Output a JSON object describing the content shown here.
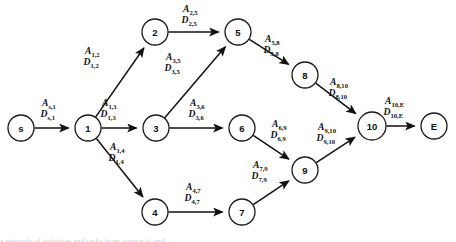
{
  "figure": {
    "type": "directed-acyclic-graph",
    "title": "",
    "background_color": "#ffffff",
    "stroke_color": "#111111",
    "node_fill": "#ffffff",
    "caption_partial": "a network of activities and tasks from source to end"
  },
  "nodes": [
    {
      "id": "s",
      "label": "s",
      "cx": 21,
      "cy": 128,
      "r": 13
    },
    {
      "id": "1",
      "label": "1",
      "cx": 88,
      "cy": 128,
      "r": 13
    },
    {
      "id": "2",
      "label": "2",
      "cx": 155,
      "cy": 32,
      "r": 13
    },
    {
      "id": "3",
      "label": "3",
      "cx": 156,
      "cy": 128,
      "r": 13
    },
    {
      "id": "4",
      "label": "4",
      "cx": 155,
      "cy": 212,
      "r": 13
    },
    {
      "id": "5",
      "label": "5",
      "cx": 238,
      "cy": 32,
      "r": 13
    },
    {
      "id": "6",
      "label": "6",
      "cx": 242,
      "cy": 128,
      "r": 13
    },
    {
      "id": "7",
      "label": "7",
      "cx": 242,
      "cy": 212,
      "r": 13
    },
    {
      "id": "8",
      "label": "8",
      "cx": 305,
      "cy": 75,
      "r": 13
    },
    {
      "id": "9",
      "label": "9",
      "cx": 305,
      "cy": 170,
      "r": 13
    },
    {
      "id": "10",
      "label": "10",
      "cx": 372,
      "cy": 126,
      "r": 14
    },
    {
      "id": "E",
      "label": "E",
      "cx": 434,
      "cy": 126,
      "r": 13
    }
  ],
  "edges": [
    {
      "from": "s",
      "to": "1",
      "activity": "A",
      "duration": "D",
      "sub": "s,1",
      "label_x": 42,
      "label_y": 106
    },
    {
      "from": "1",
      "to": "2",
      "activity": "A",
      "duration": "D",
      "sub": "1,2",
      "label_x": 85,
      "label_y": 54
    },
    {
      "from": "1",
      "to": "3",
      "activity": "A",
      "duration": "D",
      "sub": "1,3",
      "label_x": 102,
      "label_y": 106
    },
    {
      "from": "1",
      "to": "4",
      "activity": "A",
      "duration": "D",
      "sub": "1,4",
      "label_x": 110,
      "label_y": 150
    },
    {
      "from": "2",
      "to": "5",
      "activity": "A",
      "duration": "D",
      "sub": "2,5",
      "label_x": 183,
      "label_y": 12
    },
    {
      "from": "3",
      "to": "5",
      "activity": "A",
      "duration": "D",
      "sub": "3,5",
      "label_x": 166,
      "label_y": 60
    },
    {
      "from": "3",
      "to": "6",
      "activity": "A",
      "duration": "D",
      "sub": "3,6",
      "label_x": 190,
      "label_y": 106
    },
    {
      "from": "4",
      "to": "7",
      "activity": "A",
      "duration": "D",
      "sub": "4,7",
      "label_x": 186,
      "label_y": 190
    },
    {
      "from": "5",
      "to": "8",
      "activity": "A",
      "duration": "D",
      "sub": "5,8",
      "label_x": 265,
      "label_y": 42
    },
    {
      "from": "6",
      "to": "9",
      "activity": "A",
      "duration": "D",
      "sub": "6,9",
      "label_x": 272,
      "label_y": 127
    },
    {
      "from": "7",
      "to": "9",
      "activity": "A",
      "duration": "D",
      "sub": "7,9",
      "label_x": 253,
      "label_y": 168
    },
    {
      "from": "8",
      "to": "10",
      "activity": "A",
      "duration": "D",
      "sub": "8,10",
      "label_x": 330,
      "label_y": 85
    },
    {
      "from": "9",
      "to": "10",
      "activity": "A",
      "duration": "D",
      "sub": "9,10",
      "label_x": 318,
      "label_y": 130
    },
    {
      "from": "10",
      "to": "E",
      "activity": "A",
      "duration": "D",
      "sub": "10,E",
      "label_x": 385,
      "label_y": 104
    }
  ]
}
